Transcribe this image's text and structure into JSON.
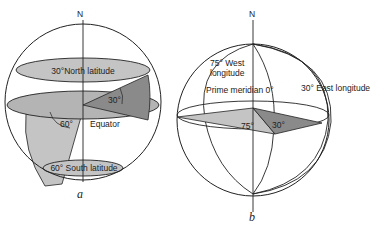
{
  "figure_a": {
    "caption": "a",
    "axis_label": "N",
    "north_latitude_label": "30°North latitude",
    "north_angle_label": "30°",
    "equator_label": "Equator",
    "south_angle_label": "60°",
    "south_latitude_label": "60° South latitude"
  },
  "figure_b": {
    "caption": "b",
    "axis_label": "N",
    "west_longitude_label_line1": "75° West",
    "west_longitude_label_line2": "longitude",
    "prime_meridian_label": "Prime meridian 0°",
    "east_longitude_label": "30° East longitude",
    "west_angle_label": "75°",
    "east_angle_label": "30°"
  },
  "colors": {
    "light_fill": "#c4c4c4",
    "mid_fill": "#a8a8a8",
    "dark_fill": "#8a8a8a",
    "stroke": "#222222"
  }
}
